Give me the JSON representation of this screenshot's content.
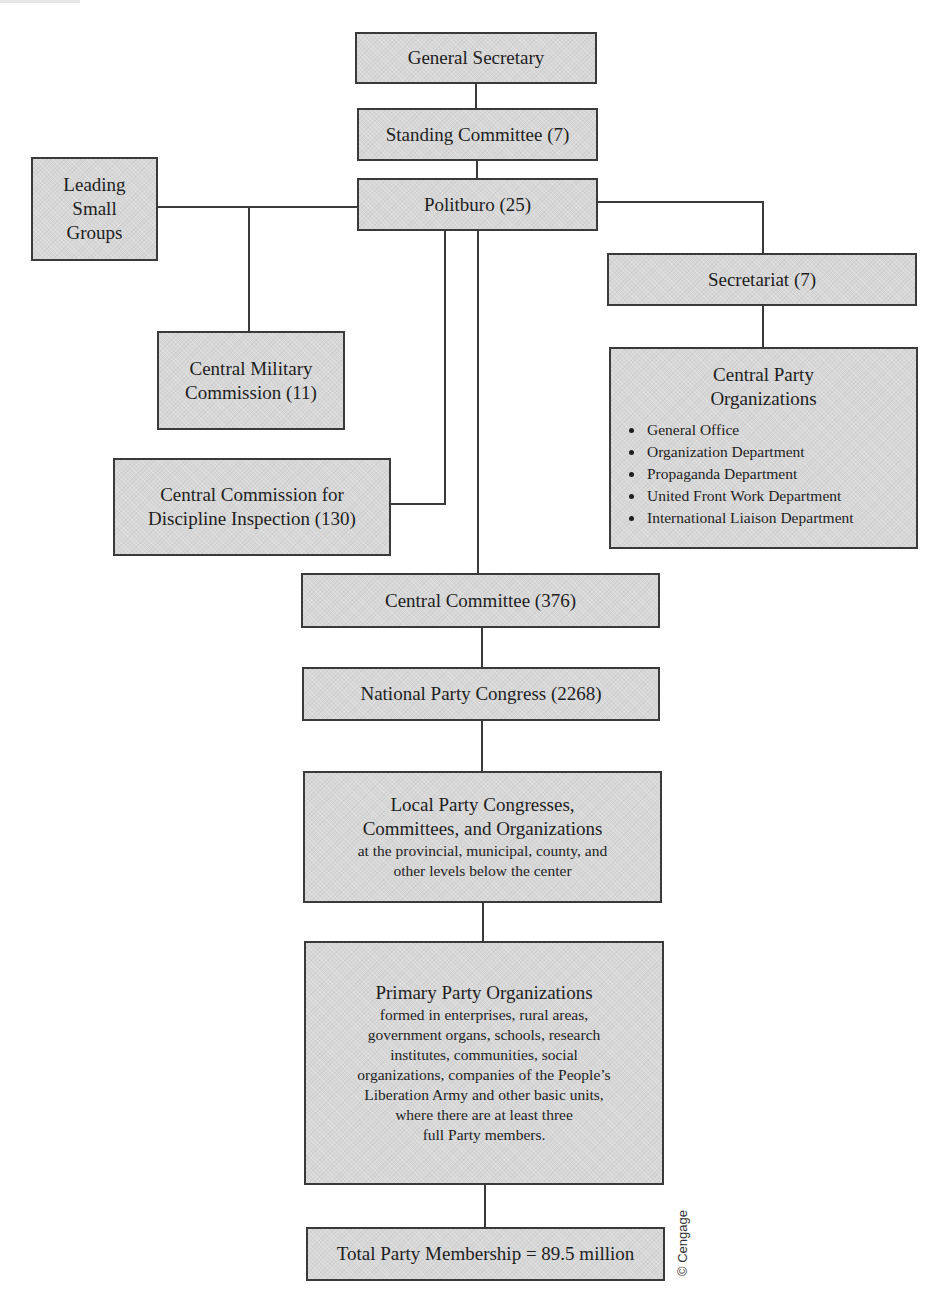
{
  "diagram": {
    "type": "org-chart",
    "colors": {
      "box_fill": "#d7d7d7",
      "box_border": "#3a3a3a",
      "connector": "#3a3a3a",
      "text": "#1e1e1e"
    },
    "nodes": {
      "general_secretary": {
        "title": "General Secretary"
      },
      "standing_committee": {
        "title": "Standing Committee (7)"
      },
      "politburo": {
        "title": "Politburo (25)"
      },
      "leading_small_groups": {
        "lines": [
          "Leading",
          "Small",
          "Groups"
        ]
      },
      "central_military_commission": {
        "lines": [
          "Central Military",
          "Commission (11)"
        ]
      },
      "ccdi": {
        "lines": [
          "Central Commission for",
          "Discipline Inspection (130)"
        ]
      },
      "secretariat": {
        "title": "Secretariat (7)"
      },
      "central_party_organizations": {
        "lines": [
          "Central Party",
          "Organizations"
        ],
        "items": [
          "General Office",
          "Organization Department",
          "Propaganda Department",
          "United Front Work Department",
          "International Liaison Department"
        ]
      },
      "central_committee": {
        "title": "Central Committee (376)"
      },
      "national_party_congress": {
        "title": "National Party Congress (2268)"
      },
      "local_party": {
        "lines": [
          "Local Party Congresses,",
          "Committees, and Organizations"
        ],
        "sub_lines": [
          "at the provincial, municipal, county, and",
          "other levels below the center"
        ]
      },
      "primary_party_organizations": {
        "title": "Primary Party Organizations",
        "sub_lines": [
          "formed in enterprises, rural areas,",
          "government organs, schools, research",
          "institutes, communities, social",
          "organizations, companies of the People’s",
          "Liberation Army and other basic units,",
          "where there are at least three",
          "full Party members."
        ]
      },
      "total_membership": {
        "title": "Total Party Membership = 89.5 million"
      }
    },
    "edges": [
      [
        "general_secretary",
        "standing_committee"
      ],
      [
        "standing_committee",
        "politburo"
      ],
      [
        "politburo",
        "leading_small_groups"
      ],
      [
        "politburo",
        "central_military_commission"
      ],
      [
        "politburo",
        "secretariat"
      ],
      [
        "politburo",
        "ccdi"
      ],
      [
        "politburo",
        "central_committee"
      ],
      [
        "secretariat",
        "central_party_organizations"
      ],
      [
        "central_committee",
        "national_party_congress"
      ],
      [
        "national_party_congress",
        "local_party"
      ],
      [
        "local_party",
        "primary_party_organizations"
      ],
      [
        "primary_party_organizations",
        "total_membership"
      ]
    ],
    "credit": "© Cengage"
  }
}
